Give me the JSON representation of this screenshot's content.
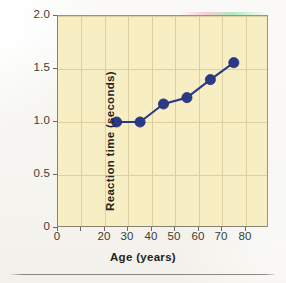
{
  "figure": {
    "plot_background": "#f8eec4",
    "grid_color": "#ddd0a0",
    "frame_color": "#8a8370",
    "series_color": "#2b3a87"
  },
  "axes": {
    "x_title": "Age (years)",
    "y_title": "Reaction time (seconds)",
    "x_ticks": [
      "0",
      "10",
      "20",
      "30",
      "40",
      "50",
      "60",
      "70",
      "80"
    ],
    "x_tick_visible": [
      true,
      false,
      true,
      true,
      true,
      true,
      true,
      true,
      true
    ],
    "y_ticks": [
      "0",
      "0.5",
      "1.0",
      "1.5",
      "2.0"
    ]
  },
  "chart_data": {
    "type": "line",
    "title": "",
    "xlabel": "Age (years)",
    "ylabel": "Reaction time (seconds)",
    "xlim": [
      0,
      90
    ],
    "ylim": [
      0,
      2.0
    ],
    "grid": true,
    "legend": "none",
    "x_tick_values": [
      0,
      10,
      20,
      30,
      40,
      50,
      60,
      70,
      80
    ],
    "x_tick_labels": [
      "0",
      "10",
      "20",
      "30",
      "40",
      "50",
      "60",
      "70",
      "80"
    ],
    "y_tick_values": [
      0,
      0.5,
      1.0,
      1.5,
      2.0
    ],
    "y_tick_labels": [
      "0",
      "0.5",
      "1.0",
      "1.5",
      "2.0"
    ],
    "marker": "filled-circle",
    "marker_color": "#2b3a87",
    "line_color": "#2b3a87",
    "series": [
      {
        "name": "Reaction time",
        "x": [
          25,
          35,
          45,
          55,
          65,
          75
        ],
        "y": [
          1.0,
          1.0,
          1.17,
          1.23,
          1.4,
          1.56
        ]
      }
    ]
  }
}
